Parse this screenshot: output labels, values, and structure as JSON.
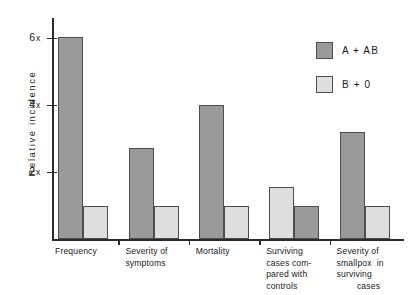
{
  "chart_data": {
    "type": "bar",
    "title": "",
    "xlabel": "",
    "ylabel": "Relative  incidence",
    "ylim": [
      0,
      6.6
    ],
    "grid": false,
    "legend_position": "top-right",
    "yticks": [
      {
        "value": 2,
        "label": "2",
        "unit": "x"
      },
      {
        "value": 4,
        "label": "4",
        "unit": "x"
      },
      {
        "value": 6,
        "label": "6",
        "unit": "x"
      }
    ],
    "categories": [
      "Frequency",
      "Severity of\nsymptoms",
      "Mortality",
      "Surviving\ncases com-\npared with\ncontrols",
      "Severity of\nsmallpox  in\nsurviving\n        cases"
    ],
    "series": [
      {
        "name": "A + AB",
        "color": "#9a9a9a",
        "values": [
          6.0,
          2.7,
          4.0,
          1.0,
          3.2
        ]
      },
      {
        "name": "B + 0",
        "color": "#dedede",
        "values": [
          1.0,
          1.0,
          1.0,
          1.55,
          1.0
        ]
      }
    ],
    "group_series_order": [
      [
        "A + AB",
        "B + 0"
      ],
      [
        "A + AB",
        "B + 0"
      ],
      [
        "A + AB",
        "B + 0"
      ],
      [
        "B + 0",
        "A + AB"
      ],
      [
        "A + AB",
        "B + 0"
      ]
    ]
  },
  "legend": {
    "entries": [
      {
        "label": "A + AB",
        "color": "#9a9a9a"
      },
      {
        "label": "B + 0",
        "color": "#dedede"
      }
    ]
  },
  "axis": {
    "y_title": "Relative  incidence"
  },
  "category_labels": [
    [
      "Frequency"
    ],
    [
      "Severity of",
      "symptoms"
    ],
    [
      "Mortality"
    ],
    [
      "Surviving",
      "cases com-",
      "pared with",
      "controls"
    ],
    [
      "Severity of",
      "smallpox  in",
      "surviving",
      "        cases"
    ]
  ],
  "tick_labels": [
    {
      "num": "2",
      "unit": "x"
    },
    {
      "num": "4",
      "unit": "x"
    },
    {
      "num": "6",
      "unit": "x"
    }
  ]
}
